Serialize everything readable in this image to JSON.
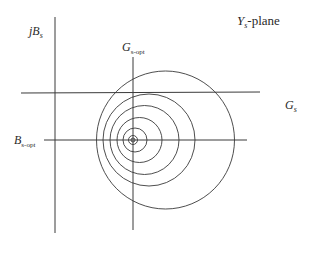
{
  "diagram": {
    "title": {
      "main": "Y",
      "sub": "s",
      "suffix": "-plane"
    },
    "labels": {
      "imag_axis": {
        "prefix": "jB",
        "sub": "s"
      },
      "real_axis": {
        "main": "G",
        "sub": "s"
      },
      "g_opt": {
        "main": "G",
        "sub": "s-opt"
      },
      "b_opt": {
        "main": "B",
        "sub": "s-opt"
      }
    },
    "axes": {
      "real_axis": {
        "x1": 21,
        "y1": 93,
        "x2": 260,
        "y2": 92
      },
      "imag_axis": {
        "x1": 55,
        "y1": 17,
        "x2": 55,
        "y2": 233
      },
      "g_opt_line": {
        "x1": 133,
        "y1": 57,
        "x2": 133,
        "y2": 230
      },
      "b_opt_line": {
        "x1": 44,
        "y1": 140,
        "x2": 247,
        "y2": 140
      }
    },
    "circles": [
      {
        "cx": 165.5,
        "cy": 140,
        "r": 69
      },
      {
        "cx": 149,
        "cy": 140,
        "r": 46
      },
      {
        "cx": 144.5,
        "cy": 140,
        "r": 34.5
      },
      {
        "cx": 139.5,
        "cy": 140,
        "r": 22.5
      },
      {
        "cx": 135,
        "cy": 140,
        "r": 12
      },
      {
        "cx": 133,
        "cy": 140,
        "r": 4.5
      },
      {
        "cx": 133,
        "cy": 140,
        "r": 2
      }
    ],
    "colors": {
      "line": "#3a3a3a",
      "text": "#2a2a2a",
      "background": "#ffffff"
    }
  }
}
